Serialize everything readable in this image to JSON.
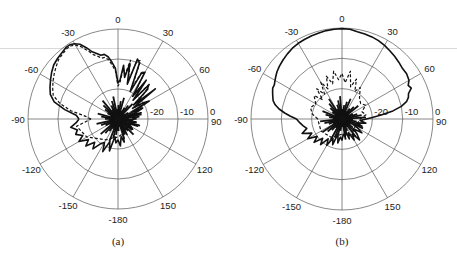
{
  "chart_data": [
    {
      "type": "polar",
      "panel": "a",
      "caption": "(a)",
      "center": [
        118,
        119
      ],
      "radius_px": 90,
      "radial_range": [
        -30,
        0
      ],
      "radial_ticks": [
        {
          "value": -20,
          "label": "-20"
        },
        {
          "value": -10,
          "label": "-10"
        },
        {
          "value": 0,
          "label": "0"
        }
      ],
      "angle_ticks": [
        0,
        30,
        60,
        90,
        120,
        150,
        -180,
        -150,
        -120,
        -90,
        -60,
        -30
      ],
      "angle_tick_labels": [
        "0",
        "30",
        "60",
        "90",
        "120",
        "150",
        "-180",
        "-150",
        "-120",
        "-90",
        "-60",
        "-30"
      ],
      "grid": true,
      "series": [
        {
          "name": "solid",
          "style": "solid",
          "points": [
            [
              -90,
              -17
            ],
            [
              -85,
              -16
            ],
            [
              -80,
              -12
            ],
            [
              -75,
              -8
            ],
            [
              -70,
              -6
            ],
            [
              -65,
              -5
            ],
            [
              -60,
              -4
            ],
            [
              -55,
              -3
            ],
            [
              -50,
              -2
            ],
            [
              -45,
              -1.5
            ],
            [
              -40,
              -1
            ],
            [
              -36,
              -0.5
            ],
            [
              -33,
              -0.5
            ],
            [
              -30,
              -1
            ],
            [
              -27,
              -2
            ],
            [
              -24,
              -4
            ],
            [
              -21,
              -6
            ],
            [
              -18,
              -7
            ],
            [
              -15,
              -8
            ],
            [
              -12,
              -8
            ],
            [
              -9,
              -9
            ],
            [
              -6,
              -11
            ],
            [
              -3,
              -13
            ],
            [
              0,
              -18
            ],
            [
              3,
              -17
            ],
            [
              6,
              -12
            ],
            [
              9,
              -16
            ],
            [
              12,
              -11
            ],
            [
              15,
              -18
            ],
            [
              18,
              -9
            ],
            [
              21,
              -10
            ],
            [
              24,
              -20
            ],
            [
              27,
              -13
            ],
            [
              30,
              -12
            ],
            [
              33,
              -21
            ],
            [
              36,
              -14
            ],
            [
              39,
              -22
            ],
            [
              42,
              -15
            ],
            [
              45,
              -16
            ],
            [
              48,
              -23
            ],
            [
              51,
              -14
            ],
            [
              54,
              -24
            ],
            [
              57,
              -20
            ],
            [
              60,
              -18
            ],
            [
              63,
              -25
            ],
            [
              66,
              -21
            ],
            [
              69,
              -23
            ],
            [
              72,
              -26
            ],
            [
              75,
              -22
            ],
            [
              78,
              -24
            ],
            [
              81,
              -27
            ],
            [
              84,
              -23
            ],
            [
              87,
              -25
            ],
            [
              90,
              -24
            ],
            [
              95,
              -27
            ],
            [
              100,
              -24
            ],
            [
              105,
              -26
            ],
            [
              110,
              -23
            ],
            [
              115,
              -27
            ],
            [
              120,
              -25
            ],
            [
              125,
              -24
            ],
            [
              130,
              -27
            ],
            [
              135,
              -26
            ],
            [
              140,
              -25
            ],
            [
              145,
              -27
            ],
            [
              150,
              -24
            ],
            [
              155,
              -27
            ],
            [
              160,
              -25
            ],
            [
              165,
              -22
            ],
            [
              170,
              -24
            ],
            [
              175,
              -21
            ],
            [
              180,
              -23
            ],
            [
              -175,
              -22
            ],
            [
              -170,
              -24
            ],
            [
              -165,
              -19
            ],
            [
              -160,
              -22
            ],
            [
              -155,
              -18
            ],
            [
              -150,
              -21
            ],
            [
              -145,
              -20
            ],
            [
              -140,
              -17
            ],
            [
              -135,
              -19
            ],
            [
              -130,
              -16
            ],
            [
              -125,
              -18
            ],
            [
              -120,
              -15
            ],
            [
              -115,
              -17
            ],
            [
              -110,
              -15
            ],
            [
              -105,
              -16
            ],
            [
              -100,
              -14
            ],
            [
              -95,
              -16
            ],
            [
              -90,
              -17
            ]
          ]
        },
        {
          "name": "dashed",
          "style": "dashed",
          "points": [
            [
              -90,
              -21
            ],
            [
              -85,
              -19
            ],
            [
              -80,
              -14
            ],
            [
              -75,
              -10
            ],
            [
              -70,
              -7
            ],
            [
              -65,
              -6
            ],
            [
              -60,
              -5
            ],
            [
              -55,
              -4
            ],
            [
              -50,
              -3
            ],
            [
              -45,
              -2
            ],
            [
              -40,
              -1.5
            ],
            [
              -36,
              -1
            ],
            [
              -33,
              -1
            ],
            [
              -30,
              -1.5
            ],
            [
              -27,
              -3
            ],
            [
              -24,
              -5
            ],
            [
              -21,
              -7
            ],
            [
              -18,
              -8
            ],
            [
              -15,
              -9
            ],
            [
              -12,
              -9
            ],
            [
              -9,
              -10
            ],
            [
              -6,
              -12
            ],
            [
              -3,
              -14
            ],
            [
              0,
              -19
            ],
            [
              3,
              -18
            ],
            [
              6,
              -13
            ],
            [
              9,
              -15
            ],
            [
              12,
              -10
            ],
            [
              15,
              -17
            ],
            [
              18,
              -10
            ],
            [
              21,
              -9
            ],
            [
              24,
              -19
            ],
            [
              27,
              -12
            ],
            [
              30,
              -13
            ],
            [
              33,
              -20
            ],
            [
              36,
              -15
            ],
            [
              39,
              -21
            ],
            [
              42,
              -14
            ],
            [
              45,
              -17
            ],
            [
              50,
              -22
            ],
            [
              55,
              -23
            ],
            [
              60,
              -19
            ],
            [
              70,
              -24
            ],
            [
              80,
              -26
            ],
            [
              90,
              -25
            ],
            [
              120,
              -26
            ],
            [
              150,
              -25
            ],
            [
              180,
              -24
            ],
            [
              -150,
              -22
            ],
            [
              -120,
              -18
            ],
            [
              -100,
              -16
            ],
            [
              -90,
              -21
            ]
          ]
        }
      ]
    },
    {
      "type": "polar",
      "panel": "b",
      "caption": "(b)",
      "center": [
        342,
        119
      ],
      "radius_px": 91,
      "radial_range": [
        -30,
        0
      ],
      "radial_ticks": [
        {
          "value": -20,
          "label": "-20"
        },
        {
          "value": -10,
          "label": "-10"
        },
        {
          "value": 0,
          "label": "0"
        }
      ],
      "angle_ticks": [
        0,
        30,
        60,
        90,
        120,
        150,
        -180,
        -150,
        -120,
        -90,
        -60,
        -30
      ],
      "angle_tick_labels": [
        "0",
        "30",
        "60",
        "90",
        "120",
        "150",
        "-180",
        "-150",
        "-120",
        "-90",
        "-60",
        "-30"
      ],
      "grid": true,
      "series": [
        {
          "name": "solid",
          "style": "solid",
          "points": [
            [
              -90,
              -15
            ],
            [
              -87,
              -13
            ],
            [
              -84,
              -11
            ],
            [
              -81,
              -9
            ],
            [
              -78,
              -7.5
            ],
            [
              -75,
              -6.5
            ],
            [
              -72,
              -6
            ],
            [
              -69,
              -5.5
            ],
            [
              -66,
              -5
            ],
            [
              -63,
              -5
            ],
            [
              -60,
              -4.5
            ],
            [
              -57,
              -4
            ],
            [
              -54,
              -3.5
            ],
            [
              -50,
              -3
            ],
            [
              -45,
              -2.5
            ],
            [
              -40,
              -2
            ],
            [
              -35,
              -1.5
            ],
            [
              -30,
              -1.2
            ],
            [
              -25,
              -1
            ],
            [
              -20,
              -0.8
            ],
            [
              -15,
              -0.6
            ],
            [
              -10,
              -0.4
            ],
            [
              -5,
              -0.3
            ],
            [
              0,
              -0.2
            ],
            [
              5,
              -0.3
            ],
            [
              10,
              -0.8
            ],
            [
              15,
              -1
            ],
            [
              20,
              -1.2
            ],
            [
              25,
              -1.5
            ],
            [
              30,
              -2
            ],
            [
              35,
              -2.5
            ],
            [
              40,
              -3
            ],
            [
              45,
              -3.5
            ],
            [
              50,
              -4
            ],
            [
              55,
              -4
            ],
            [
              60,
              -4.5
            ],
            [
              63,
              -5.5
            ],
            [
              66,
              -5
            ],
            [
              69,
              -6.5
            ],
            [
              72,
              -7
            ],
            [
              75,
              -8
            ],
            [
              78,
              -10
            ],
            [
              81,
              -13
            ],
            [
              84,
              -17
            ],
            [
              87,
              -20
            ],
            [
              90,
              -22
            ],
            [
              95,
              -24
            ],
            [
              100,
              -22
            ],
            [
              105,
              -25
            ],
            [
              110,
              -23
            ],
            [
              115,
              -26
            ],
            [
              120,
              -24
            ],
            [
              125,
              -22
            ],
            [
              130,
              -25
            ],
            [
              135,
              -23
            ],
            [
              140,
              -21
            ],
            [
              145,
              -24
            ],
            [
              150,
              -22
            ],
            [
              155,
              -25
            ],
            [
              160,
              -23
            ],
            [
              165,
              -26
            ],
            [
              170,
              -24
            ],
            [
              175,
              -25
            ],
            [
              180,
              -23
            ],
            [
              -175,
              -24
            ],
            [
              -170,
              -22
            ],
            [
              -165,
              -25
            ],
            [
              -160,
              -21
            ],
            [
              -155,
              -23
            ],
            [
              -150,
              -20
            ],
            [
              -145,
              -22
            ],
            [
              -140,
              -19
            ],
            [
              -135,
              -21
            ],
            [
              -130,
              -18
            ],
            [
              -125,
              -20
            ],
            [
              -120,
              -17
            ],
            [
              -115,
              -19
            ],
            [
              -110,
              -16
            ],
            [
              -105,
              -18
            ],
            [
              -100,
              -17
            ],
            [
              -95,
              -16
            ],
            [
              -90,
              -15
            ]
          ]
        },
        {
          "name": "dashed",
          "style": "dashed",
          "points": [
            [
              -90,
              -22
            ],
            [
              -80,
              -20
            ],
            [
              -70,
              -19
            ],
            [
              -60,
              -20
            ],
            [
              -50,
              -18
            ],
            [
              -45,
              -21
            ],
            [
              -40,
              -17
            ],
            [
              -35,
              -20
            ],
            [
              -30,
              -16
            ],
            [
              -25,
              -19
            ],
            [
              -20,
              -15
            ],
            [
              -15,
              -18
            ],
            [
              -10,
              -14
            ],
            [
              -5,
              -17
            ],
            [
              0,
              -15
            ],
            [
              5,
              -18
            ],
            [
              10,
              -14
            ],
            [
              15,
              -19
            ],
            [
              20,
              -16
            ],
            [
              25,
              -20
            ],
            [
              30,
              -18
            ],
            [
              40,
              -21
            ],
            [
              50,
              -22
            ],
            [
              60,
              -21
            ],
            [
              70,
              -23
            ],
            [
              80,
              -22
            ],
            [
              90,
              -24
            ],
            [
              120,
              -25
            ],
            [
              150,
              -24
            ],
            [
              180,
              -25
            ],
            [
              -150,
              -23
            ],
            [
              -120,
              -22
            ],
            [
              -90,
              -22
            ]
          ]
        }
      ]
    }
  ]
}
